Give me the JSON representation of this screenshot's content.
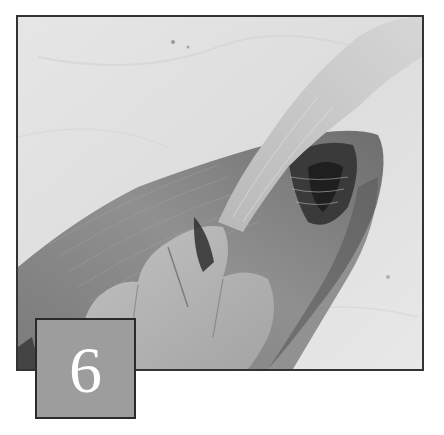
{
  "step": {
    "number": "6"
  },
  "photo": {
    "subject": "hand pulling skin and bones from a fish fillet on marble",
    "colors": {
      "frame_border": "#333333",
      "marble": "#e3e3e3",
      "fish": "#8a8a8a",
      "fish_dark": "#555555",
      "skin_strip": "#c9c9c9",
      "hand": "#b3b3b3",
      "cavity": "#2e2e2e"
    }
  },
  "badge": {
    "fill": "#9d9d9d",
    "border": "#2a2a2a",
    "text_color": "#ffffff"
  }
}
